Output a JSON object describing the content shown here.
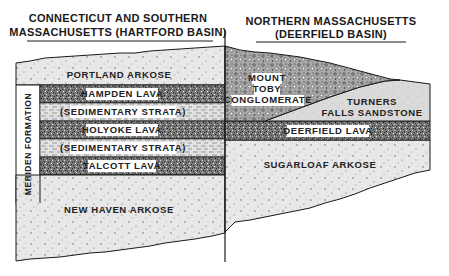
{
  "diagram": {
    "title_left": [
      "CONNECTICUT AND SOUTHERN",
      "MASSACHUSETTS (HARTFORD BASIN)"
    ],
    "title_right": [
      "NORTHERN MASSACHUSETTS",
      "(DEERFIELD BASIN)"
    ],
    "formation_label": "MERIDEN FORMATION",
    "hartford_layers": [
      {
        "name": "PORTLAND ARKOSE",
        "pattern": "arkose"
      },
      {
        "name": "HAMPDEN LAVA",
        "pattern": "lava"
      },
      {
        "name": "(SEDIMENTARY STRATA)",
        "pattern": "strata"
      },
      {
        "name": "HOLYOKE LAVA",
        "pattern": "lava"
      },
      {
        "name": "(SEDIMENTARY STRATA)",
        "pattern": "strata"
      },
      {
        "name": "TALCOTT LAVA",
        "pattern": "lava"
      },
      {
        "name": "NEW HAVEN ARKOSE",
        "pattern": "arkose"
      }
    ],
    "deerfield_layers": [
      {
        "name": [
          "MOUNT",
          "TOBY",
          "CONGLOMERATE"
        ],
        "pattern": "conglomerate"
      },
      {
        "name": [
          "TURNERS",
          "FALLS SANDSTONE"
        ],
        "pattern": "sandstone"
      },
      {
        "name": "DEERFIELD LAVA",
        "pattern": "lava"
      },
      {
        "name": "SUGARLOAF ARKOSE",
        "pattern": "arkose"
      }
    ],
    "colors": {
      "ink": "#1a1a1a",
      "arkose_fill": "#e6e6e6",
      "lava_fill": "#6e6e6e",
      "strata_fill": "#dcdcdc",
      "conglomerate_fill": "#9a9a9a",
      "sandstone_fill": "#d9d9d9"
    }
  }
}
